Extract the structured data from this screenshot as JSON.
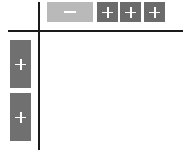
{
  "toolbar": {
    "remove_button": {
      "icon": "minus-icon",
      "color": "#b9b9b9"
    },
    "add_column_buttons": [
      {
        "icon": "plus-icon",
        "color": "#6b6b6b"
      },
      {
        "icon": "plus-icon",
        "color": "#6b6b6b"
      },
      {
        "icon": "plus-icon",
        "color": "#6b6b6b"
      }
    ]
  },
  "sidebar": {
    "add_row_buttons": [
      {
        "icon": "plus-icon",
        "color": "#707070"
      },
      {
        "icon": "plus-icon",
        "color": "#707070"
      }
    ]
  }
}
